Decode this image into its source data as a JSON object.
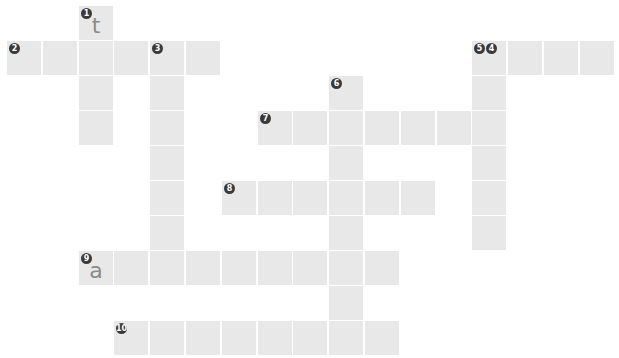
{
  "puzzle": {
    "type": "crossword",
    "cell_color": "#e8e8e8",
    "number_badge_color": "#3a3a3a",
    "letter_color": "#8a8a8a",
    "origin_x": 7,
    "origin_y": 6,
    "pitch_x": 35.8,
    "pitch_y": 35.0,
    "words": [
      {
        "number": "1",
        "direction": "down",
        "row": 0,
        "col": 2,
        "length": 4,
        "filled": "t"
      },
      {
        "number": "2",
        "direction": "across",
        "row": 1,
        "col": 0,
        "length": 6,
        "filled": ""
      },
      {
        "number": "3",
        "direction": "down",
        "row": 1,
        "col": 4,
        "length": 6,
        "filled": ""
      },
      {
        "number": "4",
        "direction": "across",
        "row": 1,
        "col": 13,
        "length": 4,
        "filled": ""
      },
      {
        "number": "5",
        "direction": "down",
        "row": 1,
        "col": 13,
        "length": 6,
        "filled": ""
      },
      {
        "number": "6",
        "direction": "down",
        "row": 2,
        "col": 9,
        "length": 8,
        "filled": ""
      },
      {
        "number": "7",
        "direction": "across",
        "row": 3,
        "col": 7,
        "length": 7,
        "filled": ""
      },
      {
        "number": "8",
        "direction": "across",
        "row": 5,
        "col": 6,
        "length": 6,
        "filled": ""
      },
      {
        "number": "9",
        "direction": "across",
        "row": 7,
        "col": 2,
        "length": 9,
        "filled": "a"
      },
      {
        "number": "10",
        "direction": "across",
        "row": 9,
        "col": 3,
        "length": 8,
        "filled": ""
      }
    ]
  }
}
